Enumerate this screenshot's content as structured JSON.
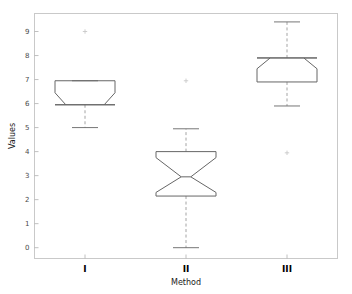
{
  "chart_data": {
    "type": "box",
    "title": "",
    "subtitle": "",
    "xlabel": "Method",
    "ylabel": "Values",
    "categories": [
      "I",
      "II",
      "III"
    ],
    "xtick_labels": [
      "I",
      "II",
      "III"
    ],
    "ytick_labels": [
      "0",
      "1",
      "2",
      "3",
      "4",
      "5",
      "6",
      "7",
      "8",
      "9"
    ],
    "ytick_values": [
      0,
      1,
      2,
      3,
      4,
      5,
      6,
      7,
      8,
      9
    ],
    "ylim": [
      -0.45,
      9.75
    ],
    "xlim": [
      0.5,
      3.5
    ],
    "grid": false,
    "legend": null,
    "notched": true,
    "orientation": "vertical",
    "boxes": [
      {
        "category": "I",
        "whisker_low": 5.0,
        "q1": 5.95,
        "median": 5.95,
        "q3": 6.95,
        "whisker_high": 6.95,
        "notch_low": 5.95,
        "notch_high": 6.45,
        "notch_half_width_frac": 0.18,
        "outliers": [
          9.0
        ]
      },
      {
        "category": "II",
        "whisker_low": 0.0,
        "q1": 2.15,
        "median": 2.95,
        "q3": 4.0,
        "whisker_high": 4.95,
        "notch_low": 2.3,
        "notch_high": 3.75,
        "notch_half_width_frac": 0.42,
        "outliers": [
          6.95
        ]
      },
      {
        "category": "III",
        "whisker_low": 5.9,
        "q1": 6.9,
        "median": 7.9,
        "q3": 7.9,
        "whisker_high": 9.4,
        "notch_low": 7.45,
        "notch_high": 7.9,
        "notch_half_width_frac": 0.22,
        "outliers": [
          3.95
        ]
      }
    ],
    "colors": {
      "box_line": "#666666",
      "whisker_line": "#9a9a9a",
      "cap_line": "#666666",
      "outlier_marker": "#c8c8c8",
      "frame": "#c9c9c9",
      "tick": "#b0b0b0",
      "background": "#ffffff",
      "text": "#4a4a4a"
    }
  },
  "axis": {
    "ylabel": "Values",
    "xlabel": "Method",
    "ytick_0": "0",
    "ytick_1": "1",
    "ytick_2": "2",
    "ytick_3": "3",
    "ytick_4": "4",
    "ytick_5": "5",
    "ytick_6": "6",
    "ytick_7": "7",
    "ytick_8": "8",
    "ytick_9": "9",
    "xtick_0": "I",
    "xtick_1": "II",
    "xtick_2": "III"
  }
}
